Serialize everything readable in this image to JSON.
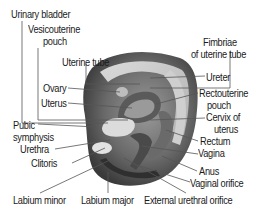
{
  "diagram": {
    "labels": {
      "urinary_bladder": "Urinary bladder",
      "vesicouterine_pouch_1": "Vesicouterine",
      "vesicouterine_pouch_2": "pouch",
      "uterine_tube": "Uterine tube",
      "fimbriae_1": "Fimbriae",
      "fimbriae_2": "of uterine tube",
      "ovary": "Ovary",
      "uterus": "Uterus",
      "ureter": "Ureter",
      "rectouterine_1": "Rectouterine",
      "rectouterine_2": "pouch",
      "cervix_1": "Cervix of",
      "cervix_2": "uterus",
      "pubic_1": "Pubic",
      "pubic_2": "symphysis",
      "urethra": "Urethra",
      "rectum": "Rectum",
      "vagina": "Vagina",
      "clitoris": "Clitoris",
      "anus": "Anus",
      "vaginal_orifice": "Vaginal orifice",
      "labium_minor": "Labium minor",
      "labium_major": "Labium major",
      "external_urethral_orifice": "External urethral orifice"
    },
    "colors": {
      "text": "#1a1a1a",
      "leader": "#555555",
      "tissue_dark": "#3a3a3a",
      "tissue_mid": "#8a8a8a",
      "tissue_light": "#d6d6d6",
      "background": "#ffffff"
    }
  }
}
